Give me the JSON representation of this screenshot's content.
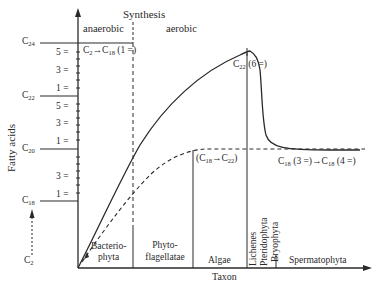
{
  "title": "Synthesis",
  "phases": {
    "anaerobic": "anaerobic",
    "aerobic": "aerobic"
  },
  "axes": {
    "y_label": "Fatty acids",
    "x_label": "Taxon",
    "y_ticks": [
      {
        "label": "C",
        "sub": "24"
      },
      {
        "label": "5 ="
      },
      {
        "label": "3 ="
      },
      {
        "label": "1 ="
      },
      {
        "label": "C",
        "sub": "22"
      },
      {
        "label": "5 ="
      },
      {
        "label": "3 ="
      },
      {
        "label": "1 ="
      },
      {
        "label": "C",
        "sub": "20"
      },
      {
        "label": "3 ="
      },
      {
        "label": "1 ="
      },
      {
        "label": "C",
        "sub": "18"
      },
      {
        "label": "C",
        "sub": "2"
      }
    ]
  },
  "taxa": {
    "bacteriophyta": "Bacterio-\nphyta",
    "bact_1": "Bacterio-",
    "bact_2": "phyta",
    "phyto_1": "Phyto-",
    "phyto_2": "flagellatae",
    "algae": "Algae",
    "lichenes": "Lichenes",
    "pteridophyta": "Pteridophyta",
    "bryophyta": "Bryophyta",
    "spermatophyta": "Spermatophyta"
  },
  "annotations": {
    "c2_c18_a": "C",
    "c2_c18_sub1": "2",
    "c2_c18_b": "→C",
    "c2_c18_sub2": "18",
    "c2_c18_c": " (1 =)",
    "c22_a": "C",
    "c22_sub": "22",
    "c22_b": " (6 =)",
    "c18_c22_a": "(C",
    "c18_c22_sub1": "18",
    "c18_c22_b": "→C",
    "c18_c22_sub2": "22",
    "c18_c22_c": ")",
    "c18_c18_a": "C",
    "c18_c18_sub1": "18",
    "c18_c18_b": " (3 =)→C",
    "c18_c18_sub2": "18",
    "c18_c18_c": " (4 =)"
  },
  "colors": {
    "ink": "#2a2a2a",
    "background": "#ffffff"
  }
}
